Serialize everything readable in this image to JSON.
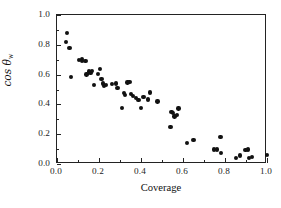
{
  "figure": {
    "background_color": "#ffffff",
    "frame_color": "#232323",
    "marker_color": "#111111"
  },
  "chart_data": {
    "type": "scatter",
    "title": "",
    "xlabel": "Coverage",
    "ylabel": "cos θ",
    "ylabel_subscript": "w",
    "xlim": [
      0.0,
      1.0
    ],
    "ylim": [
      0.0,
      1.0
    ],
    "grid": false,
    "legend": null,
    "xticks": [
      "0.0",
      "0.2",
      "0.4",
      "0.6",
      "0.8",
      "1.0"
    ],
    "xtick_values": [
      0.0,
      0.2,
      0.4,
      0.6,
      0.8,
      1.0
    ],
    "yticks": [
      "0.0",
      "0.2",
      "0.4",
      "0.6",
      "0.8",
      "1.0"
    ],
    "ytick_values": [
      0.0,
      0.2,
      0.4,
      0.6,
      0.8,
      1.0
    ],
    "minor_xtick_values": [
      0.1,
      0.3,
      0.5,
      0.7,
      0.9
    ],
    "minor_ytick_values": [
      0.1,
      0.3,
      0.5,
      0.7,
      0.9
    ],
    "marker": "filled-circle",
    "marker_size_px": 4.3,
    "series": [
      {
        "name": "cos theta_w vs coverage",
        "points": [
          [
            0.047,
            0.88
          ],
          [
            0.043,
            0.82
          ],
          [
            0.06,
            0.78
          ],
          [
            0.068,
            0.585
          ],
          [
            0.105,
            0.7
          ],
          [
            0.118,
            0.705
          ],
          [
            0.12,
            0.69
          ],
          [
            0.135,
            0.69
          ],
          [
            0.14,
            0.6
          ],
          [
            0.152,
            0.62
          ],
          [
            0.16,
            0.61
          ],
          [
            0.168,
            0.625
          ],
          [
            0.175,
            0.53
          ],
          [
            0.196,
            0.605
          ],
          [
            0.205,
            0.638
          ],
          [
            0.212,
            0.572
          ],
          [
            0.218,
            0.54
          ],
          [
            0.225,
            0.522
          ],
          [
            0.232,
            0.528
          ],
          [
            0.262,
            0.535
          ],
          [
            0.28,
            0.54
          ],
          [
            0.288,
            0.512
          ],
          [
            0.31,
            0.375
          ],
          [
            0.318,
            0.478
          ],
          [
            0.325,
            0.465
          ],
          [
            0.335,
            0.548
          ],
          [
            0.345,
            0.552
          ],
          [
            0.352,
            0.468
          ],
          [
            0.362,
            0.455
          ],
          [
            0.375,
            0.442
          ],
          [
            0.388,
            0.43
          ],
          [
            0.4,
            0.375
          ],
          [
            0.412,
            0.448
          ],
          [
            0.432,
            0.432
          ],
          [
            0.442,
            0.48
          ],
          [
            0.478,
            0.42
          ],
          [
            0.54,
            0.25
          ],
          [
            0.545,
            0.348
          ],
          [
            0.552,
            0.34
          ],
          [
            0.56,
            0.318
          ],
          [
            0.57,
            0.33
          ],
          [
            0.578,
            0.372
          ],
          [
            0.618,
            0.14
          ],
          [
            0.65,
            0.162
          ],
          [
            0.748,
            0.098
          ],
          [
            0.762,
            0.098
          ],
          [
            0.778,
            0.182
          ],
          [
            0.782,
            0.072
          ],
          [
            0.852,
            0.04
          ],
          [
            0.872,
            0.058
          ],
          [
            0.898,
            0.095
          ],
          [
            0.908,
            0.098
          ],
          [
            0.915,
            0.042
          ],
          [
            0.93,
            0.048
          ],
          [
            1.0,
            0.06
          ]
        ]
      }
    ]
  }
}
